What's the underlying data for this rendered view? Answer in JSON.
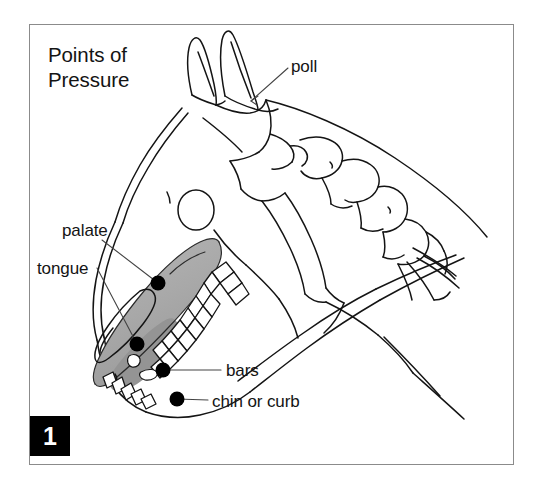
{
  "figure": {
    "title_lines": [
      "Points of",
      "Pressure"
    ],
    "number": "1",
    "caption_title": "Points of Pressure",
    "frame_color": "#8b8b8b",
    "ink_color": "#141414",
    "shading_color": "#a9a9a9",
    "marker_color": "#000000",
    "background_color": "#ffffff",
    "badge_background": "#000000",
    "badge_text_color": "#ffffff"
  },
  "labels": {
    "poll": "poll",
    "palate": "palate",
    "tongue": "tongue",
    "bars": "bars",
    "chin_or_curb": "chin or curb"
  },
  "pressure_points": [
    {
      "name": "palate-point",
      "label": "palate",
      "x": 158,
      "y": 283
    },
    {
      "name": "tongue-point",
      "label": "tongue",
      "x": 137,
      "y": 344
    },
    {
      "name": "bars-point",
      "label": "bars",
      "x": 163,
      "y": 370
    },
    {
      "name": "chin-or-curb-point",
      "label": "chin or curb",
      "x": 177,
      "y": 399
    }
  ],
  "illustration": {
    "subject": "horse-skull-profile",
    "description": "Line drawing of a horse head in profile showing the skull, ears, cervical vertebrae, teeth and shaded mouth interior with four labelled points of rein pressure.",
    "parts": [
      "ears",
      "skull",
      "eye-socket",
      "cervical-vertebrae",
      "neck-outline",
      "upper-teeth",
      "lower-teeth",
      "tongue-outline",
      "mouth-shading",
      "lower-jaw"
    ]
  }
}
